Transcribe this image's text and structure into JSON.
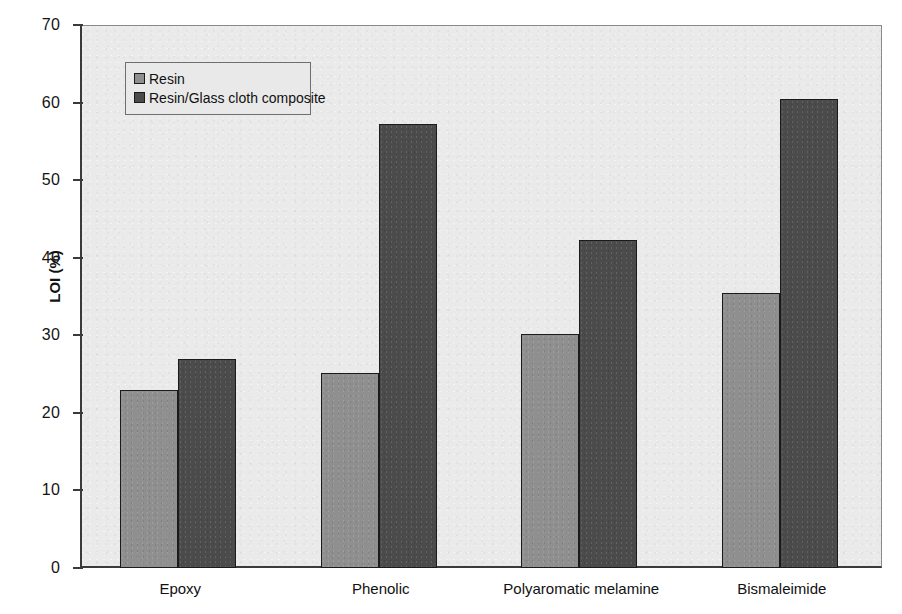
{
  "chart_data": {
    "type": "bar",
    "title": "",
    "subtitle": "",
    "xlabel": "",
    "ylabel": "LOI (%)",
    "ylim": [
      0,
      70
    ],
    "yticks": [
      0,
      10,
      20,
      30,
      40,
      50,
      60,
      70
    ],
    "ytick_labels": [
      "0",
      "10",
      "20",
      "30",
      "40",
      "50",
      "60",
      "70"
    ],
    "grid": false,
    "legend_position": "upper left",
    "categories": [
      "Epoxy",
      "Phenolic",
      "Polyaromatic melamine",
      "Bismaleimide"
    ],
    "series": [
      {
        "name": "Resin",
        "color": "#8f8f8f",
        "values": [
          23.0,
          25.1,
          30.2,
          35.4
        ]
      },
      {
        "name": "Resin/Glass cloth composite",
        "color": "#4b4b4b",
        "values": [
          26.9,
          57.2,
          42.3,
          60.4
        ]
      }
    ]
  },
  "legend": {
    "items": [
      {
        "label": "Resin"
      },
      {
        "label": "Resin/Glass cloth composite"
      }
    ]
  },
  "colors": {
    "series_resin": "#8f8f8f",
    "series_composite": "#4b4b4b",
    "plot_background": "#eaeaea",
    "axis": "#3a3a3a"
  }
}
